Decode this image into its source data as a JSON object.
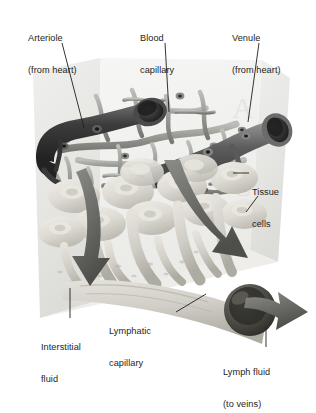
{
  "figure": {
    "background_color": "#ffffff",
    "ink_color": "#1e1e1e",
    "panel_color": "#e8e8e6",
    "vessel_dark_color": "#3a3a3a",
    "vessel_mid_color": "#8d8d8d",
    "tissue_cell_color": "#d8d6cf",
    "lymph_color": "#cfcdc6"
  },
  "labels": {
    "arteriole": {
      "line1": "Arteriole",
      "line2": "(from heart)"
    },
    "blood_capillary": {
      "line1": "Blood",
      "line2": "capillary"
    },
    "venule": {
      "line1": "Venule",
      "line2": "(from heart)"
    },
    "tissue_cells": {
      "line1": "Tissue",
      "line2": "cells"
    },
    "interstitial_fluid": {
      "line1": "Interstitial",
      "line2": "fluid"
    },
    "lymphatic_capillary": {
      "line1": "Lymphatic",
      "line2": "capillary"
    },
    "lymph_fluid": {
      "line1": "Lymph fluid",
      "line2": "(to veins)"
    }
  },
  "structures": {
    "arteriole_name": "arteriole-vessel",
    "venule_name": "venule-vessel",
    "capillary_bed_name": "blood-capillary-network",
    "tissue_cell_count": 11,
    "lymph_trunk_name": "lymphatic-capillary-trunk",
    "flow_arrows": [
      "interstitial-fluid-arrow",
      "lymph-uptake-arrow",
      "lymph-outflow-arrow"
    ]
  }
}
